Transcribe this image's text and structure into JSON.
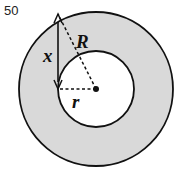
{
  "problem": {
    "number": "50"
  },
  "figure": {
    "colors": {
      "ring_fill": "#d9d9d9",
      "inner_fill": "#ffffff",
      "stroke": "#111111"
    },
    "outer_circle": {
      "cx": 96,
      "cy": 89,
      "r": 77
    },
    "inner_circle": {
      "cx": 96,
      "cy": 89,
      "r": 38
    },
    "center_dot": {
      "cx": 96,
      "cy": 89,
      "r": 3
    },
    "labels": {
      "R": "R",
      "r": "r",
      "x": "x"
    }
  }
}
